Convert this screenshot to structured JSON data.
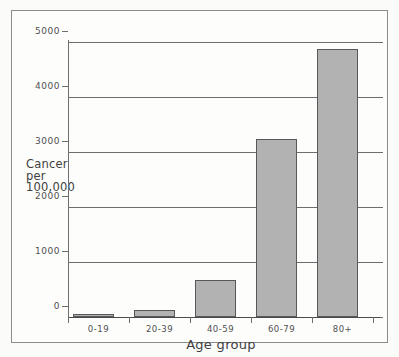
{
  "chart_data": {
    "type": "bar",
    "title": "",
    "subtitle": "",
    "xlabel": "Age group",
    "ylabel": "Cancer per 100,000",
    "ylabel_lines": [
      "Cancer",
      "per",
      "100,000"
    ],
    "categories": [
      "0-19",
      "20-39",
      "40-59",
      "60-79",
      "80+"
    ],
    "values": [
      25,
      130,
      680,
      3230,
      4870
    ],
    "ylim": [
      0,
      5000
    ],
    "ytick_labels": [
      "0",
      "1000",
      "2000",
      "3000",
      "4000",
      "5000"
    ],
    "ytick_values": [
      0,
      1000,
      2000,
      3000,
      4000,
      5000
    ],
    "grid": true,
    "legend": null,
    "series": [
      {
        "name": "Cancer incidence",
        "values": [
          25,
          130,
          680,
          3230,
          4870
        ]
      }
    ],
    "bar_fill_color": "#b2b2b2",
    "bar_border_color": "#585858",
    "axis_color": "#6e6e6e",
    "frame_color": "#8c8c8c",
    "background_color": "#fdfdfc"
  }
}
